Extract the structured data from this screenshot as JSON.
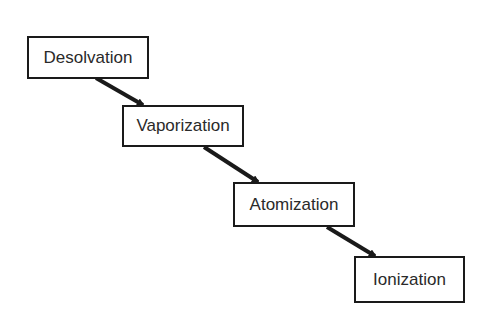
{
  "diagram": {
    "steps": [
      {
        "label": "Desolvation",
        "x": 27,
        "y": 36,
        "w": 122,
        "h": 43
      },
      {
        "label": "Vaporization",
        "x": 122,
        "y": 105,
        "w": 122,
        "h": 42
      },
      {
        "label": "Atomization",
        "x": 233,
        "y": 182,
        "w": 122,
        "h": 45
      },
      {
        "label": "Ionization",
        "x": 354,
        "y": 256,
        "w": 111,
        "h": 47
      }
    ],
    "arrows": [
      {
        "from": 0,
        "to": 1,
        "x1": 96,
        "y1": 78,
        "x2": 143,
        "y2": 105
      },
      {
        "from": 1,
        "to": 2,
        "x1": 204,
        "y1": 147,
        "x2": 258,
        "y2": 182
      },
      {
        "from": 2,
        "to": 3,
        "x1": 327,
        "y1": 227,
        "x2": 375,
        "y2": 256
      }
    ],
    "colors": {
      "line": "#1a1a1a",
      "text": "#2a2a2a",
      "background": "#ffffff"
    }
  }
}
